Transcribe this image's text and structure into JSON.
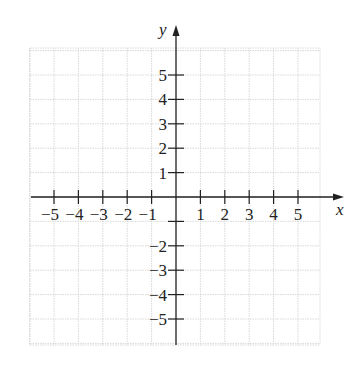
{
  "chart_data": {
    "type": "scatter",
    "title": "",
    "xlabel": "x",
    "ylabel": "y",
    "xlim": [
      -6,
      6
    ],
    "ylim": [
      -6,
      6
    ],
    "grid": true,
    "x_ticks": [
      -5,
      -4,
      -3,
      -2,
      -1,
      1,
      2,
      3,
      4,
      5
    ],
    "y_ticks": [
      5,
      4,
      3,
      2,
      1,
      -1,
      -2,
      -3,
      -4,
      -5
    ],
    "x_tick_labels": [
      "−5",
      "−4",
      "−3",
      "−2",
      "−1",
      "1",
      "2",
      "3",
      "4",
      "5"
    ],
    "y_tick_labels": [
      "5",
      "4",
      "3",
      "2",
      "1",
      "",
      "−2",
      "−3",
      "−4",
      "−5"
    ],
    "series": [],
    "colors": {
      "axis": "#222222",
      "grid": "#d8d8d8",
      "background": "#ffffff"
    }
  },
  "labels": {
    "x_axis": "x",
    "y_axis": "y"
  }
}
